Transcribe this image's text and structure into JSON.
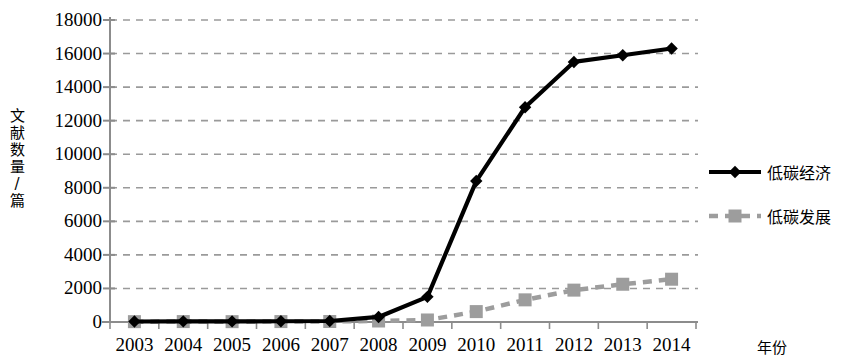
{
  "chart_data": {
    "type": "line",
    "title": "",
    "xlabel": "年份",
    "ylabel": "文献数量/篇",
    "categories": [
      "2003",
      "2004",
      "2005",
      "2006",
      "2007",
      "2008",
      "2009",
      "2010",
      "2011",
      "2012",
      "2013",
      "2014"
    ],
    "ylim": [
      0,
      18000
    ],
    "ytick_values": [
      0,
      2000,
      4000,
      6000,
      8000,
      10000,
      12000,
      14000,
      16000,
      18000
    ],
    "ytick_labels": [
      "0",
      "2000",
      "4000",
      "6000",
      "8000",
      "10000",
      "12000",
      "14000",
      "16000",
      "18000"
    ],
    "grid": true,
    "grid_style": "dashed",
    "grid_color": "#9a9a9a",
    "legend_position": "right",
    "series": [
      {
        "name": "低碳经济",
        "color": "#000000",
        "line_style": "solid",
        "marker": "diamond",
        "values": [
          30,
          40,
          35,
          45,
          60,
          300,
          1500,
          8400,
          12800,
          15500,
          15900,
          16300
        ]
      },
      {
        "name": "低碳发展",
        "color": "#9d9d9d",
        "line_style": "dashed",
        "marker": "square",
        "values": [
          20,
          25,
          20,
          25,
          30,
          60,
          120,
          620,
          1320,
          1900,
          2250,
          2550
        ]
      }
    ]
  },
  "axes": {
    "y_axis_title": "文献数量/篇",
    "y_axis_title_chars": [
      "文",
      "献",
      "数",
      "量",
      "/",
      "篇"
    ],
    "x_axis_title": "年份"
  },
  "legend": {
    "items": [
      {
        "label": "低碳经济"
      },
      {
        "label": "低碳发展"
      }
    ]
  },
  "colors": {
    "series1": "#000000",
    "series2": "#9d9d9d",
    "axis": "#8c8c8c",
    "grid": "#9a9a9a",
    "text": "#000000"
  }
}
